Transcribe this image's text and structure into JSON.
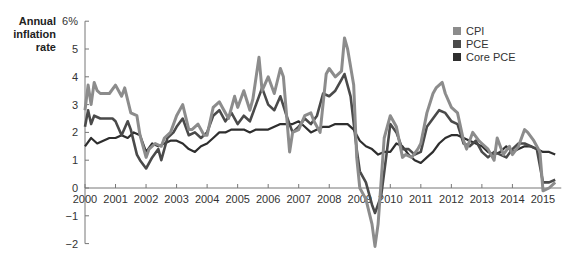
{
  "chart_data": {
    "type": "line",
    "title": "",
    "ylabel": "Annual inflation rate",
    "xlabel": "",
    "ylim": [
      -2,
      6
    ],
    "xlim": [
      2000,
      2015.5
    ],
    "y_ticks": [
      "6%",
      "5",
      "4",
      "3",
      "2",
      "1",
      "0",
      "−1",
      "−2"
    ],
    "y_tick_values": [
      6,
      5,
      4,
      3,
      2,
      1,
      0,
      -1,
      -2
    ],
    "x_ticks": [
      "2000",
      "2001",
      "2002",
      "2003",
      "2004",
      "2005",
      "2006",
      "2007",
      "2008",
      "2009",
      "2010",
      "2011",
      "2012",
      "2013",
      "2014",
      "2015"
    ],
    "grid": false,
    "legend_position": "top-right",
    "series": [
      {
        "name": "CPI",
        "color": "#8c8c8c",
        "x": [
          2000.0,
          2000.1,
          2000.2,
          2000.3,
          2000.4,
          2000.5,
          2000.6,
          2000.8,
          2001.0,
          2001.2,
          2001.3,
          2001.5,
          2001.7,
          2001.8,
          2002.0,
          2002.1,
          2002.3,
          2002.5,
          2002.6,
          2002.8,
          2003.0,
          2003.2,
          2003.4,
          2003.5,
          2003.7,
          2003.9,
          2004.0,
          2004.2,
          2004.4,
          2004.5,
          2004.7,
          2004.9,
          2005.0,
          2005.2,
          2005.4,
          2005.5,
          2005.7,
          2005.8,
          2006.0,
          2006.2,
          2006.4,
          2006.5,
          2006.7,
          2006.8,
          2007.0,
          2007.2,
          2007.4,
          2007.5,
          2007.7,
          2007.9,
          2008.0,
          2008.2,
          2008.4,
          2008.5,
          2008.6,
          2008.8,
          2008.9,
          2009.0,
          2009.2,
          2009.4,
          2009.5,
          2009.6,
          2009.8,
          2010.0,
          2010.2,
          2010.4,
          2010.5,
          2010.7,
          2010.9,
          2011.0,
          2011.2,
          2011.4,
          2011.5,
          2011.7,
          2011.8,
          2012.0,
          2012.2,
          2012.4,
          2012.5,
          2012.7,
          2012.9,
          2013.0,
          2013.2,
          2013.4,
          2013.5,
          2013.7,
          2013.9,
          2014.0,
          2014.2,
          2014.4,
          2014.5,
          2014.7,
          2014.9,
          2015.0,
          2015.2,
          2015.4
        ],
        "values": [
          2.8,
          3.7,
          3.0,
          3.8,
          3.5,
          3.4,
          3.4,
          3.4,
          3.7,
          3.3,
          3.6,
          2.7,
          2.6,
          1.9,
          1.1,
          1.4,
          1.6,
          1.5,
          1.8,
          2.0,
          2.6,
          3.0,
          2.1,
          2.1,
          2.3,
          1.9,
          1.9,
          2.9,
          3.1,
          2.9,
          2.5,
          3.3,
          2.9,
          3.5,
          2.8,
          3.2,
          4.7,
          3.5,
          4.0,
          3.4,
          4.3,
          4.0,
          1.3,
          2.0,
          2.1,
          2.6,
          2.7,
          2.4,
          2.0,
          4.1,
          4.3,
          4.0,
          4.2,
          5.4,
          5.0,
          3.7,
          1.1,
          0.0,
          -0.4,
          -1.3,
          -2.1,
          -1.3,
          1.8,
          2.6,
          2.2,
          1.1,
          1.2,
          1.1,
          1.4,
          1.6,
          2.7,
          3.4,
          3.6,
          3.8,
          3.4,
          2.9,
          2.7,
          1.7,
          1.4,
          2.0,
          1.7,
          1.6,
          1.4,
          1.0,
          1.8,
          1.2,
          1.5,
          1.2,
          1.5,
          2.1,
          2.0,
          1.7,
          1.3,
          -0.1,
          0.0,
          0.2
        ]
      },
      {
        "name": "PCE",
        "color": "#4a4a4a",
        "x": [
          2000.0,
          2000.1,
          2000.2,
          2000.3,
          2000.5,
          2000.7,
          2000.9,
          2001.0,
          2001.2,
          2001.4,
          2001.5,
          2001.7,
          2001.8,
          2002.0,
          2002.2,
          2002.4,
          2002.5,
          2002.7,
          2002.9,
          2003.0,
          2003.2,
          2003.4,
          2003.6,
          2003.8,
          2004.0,
          2004.2,
          2004.4,
          2004.6,
          2004.8,
          2005.0,
          2005.2,
          2005.4,
          2005.6,
          2005.8,
          2006.0,
          2006.2,
          2006.4,
          2006.6,
          2006.8,
          2007.0,
          2007.2,
          2007.4,
          2007.6,
          2007.8,
          2008.0,
          2008.2,
          2008.4,
          2008.5,
          2008.7,
          2008.9,
          2009.0,
          2009.2,
          2009.4,
          2009.5,
          2009.7,
          2009.9,
          2010.0,
          2010.2,
          2010.4,
          2010.6,
          2010.8,
          2011.0,
          2011.2,
          2011.4,
          2011.6,
          2011.8,
          2012.0,
          2012.2,
          2012.4,
          2012.6,
          2012.8,
          2013.0,
          2013.2,
          2013.4,
          2013.6,
          2013.8,
          2014.0,
          2014.2,
          2014.4,
          2014.6,
          2014.8,
          2015.0,
          2015.2,
          2015.4
        ],
        "values": [
          2.2,
          2.8,
          2.3,
          2.6,
          2.5,
          2.5,
          2.5,
          2.4,
          1.9,
          2.4,
          2.1,
          1.2,
          1.0,
          0.7,
          1.1,
          1.4,
          1.0,
          1.8,
          2.0,
          2.2,
          2.5,
          1.9,
          2.0,
          1.8,
          2.0,
          2.6,
          2.8,
          2.4,
          2.7,
          2.3,
          2.6,
          2.4,
          3.0,
          3.6,
          3.0,
          2.8,
          3.3,
          2.6,
          2.0,
          2.2,
          2.5,
          2.3,
          2.6,
          3.4,
          3.3,
          3.5,
          3.9,
          4.1,
          3.3,
          1.4,
          0.6,
          0.2,
          -0.6,
          -0.9,
          -0.3,
          1.4,
          2.3,
          2.0,
          1.4,
          1.4,
          1.2,
          1.3,
          2.2,
          2.5,
          2.8,
          2.7,
          2.4,
          2.3,
          1.6,
          1.5,
          1.7,
          1.3,
          1.1,
          1.3,
          1.2,
          1.1,
          1.4,
          1.6,
          1.6,
          1.5,
          1.4,
          0.2,
          0.2,
          0.3
        ]
      },
      {
        "name": "Core PCE",
        "color": "#2e2e2e",
        "x": [
          2000.0,
          2000.2,
          2000.4,
          2000.6,
          2000.8,
          2001.0,
          2001.2,
          2001.4,
          2001.6,
          2001.8,
          2002.0,
          2002.2,
          2002.4,
          2002.6,
          2002.8,
          2003.0,
          2003.2,
          2003.4,
          2003.6,
          2003.8,
          2004.0,
          2004.2,
          2004.4,
          2004.6,
          2004.8,
          2005.0,
          2005.2,
          2005.4,
          2005.6,
          2005.8,
          2006.0,
          2006.2,
          2006.4,
          2006.6,
          2006.8,
          2007.0,
          2007.2,
          2007.4,
          2007.6,
          2007.8,
          2008.0,
          2008.2,
          2008.4,
          2008.6,
          2008.8,
          2009.0,
          2009.2,
          2009.4,
          2009.6,
          2009.8,
          2010.0,
          2010.2,
          2010.4,
          2010.6,
          2010.8,
          2011.0,
          2011.2,
          2011.4,
          2011.6,
          2011.8,
          2012.0,
          2012.2,
          2012.4,
          2012.6,
          2012.8,
          2013.0,
          2013.2,
          2013.4,
          2013.6,
          2013.8,
          2014.0,
          2014.2,
          2014.4,
          2014.6,
          2014.8,
          2015.0,
          2015.2,
          2015.4
        ],
        "values": [
          1.5,
          1.8,
          1.6,
          1.7,
          1.8,
          1.8,
          1.9,
          1.8,
          2.0,
          1.9,
          1.3,
          1.6,
          1.5,
          1.6,
          1.7,
          1.7,
          1.6,
          1.4,
          1.3,
          1.5,
          1.6,
          1.8,
          2.0,
          2.0,
          2.1,
          2.1,
          2.1,
          2.0,
          2.1,
          2.1,
          2.1,
          2.2,
          2.3,
          2.3,
          2.3,
          2.4,
          2.2,
          2.0,
          2.1,
          2.2,
          2.2,
          2.3,
          2.3,
          2.3,
          2.1,
          1.7,
          1.5,
          1.4,
          1.2,
          1.3,
          1.3,
          1.6,
          1.5,
          1.2,
          1.0,
          0.9,
          1.1,
          1.3,
          1.6,
          1.8,
          1.9,
          1.9,
          1.8,
          1.7,
          1.6,
          1.5,
          1.3,
          1.2,
          1.3,
          1.5,
          1.3,
          1.4,
          1.5,
          1.5,
          1.4,
          1.3,
          1.3,
          1.2
        ]
      }
    ]
  },
  "axis": {
    "ylabel_lines": [
      "Annual",
      "inflation",
      "rate"
    ]
  },
  "legend": {
    "items": [
      {
        "label": "CPI",
        "color": "#8c8c8c"
      },
      {
        "label": "PCE",
        "color": "#4a4a4a"
      },
      {
        "label": "Core PCE",
        "color": "#2e2e2e"
      }
    ]
  }
}
